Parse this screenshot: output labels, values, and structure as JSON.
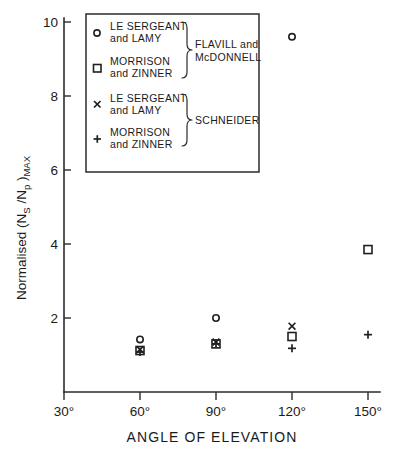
{
  "chart_data": {
    "type": "scatter",
    "title": "",
    "xlabel": "ANGLE OF ELEVATION",
    "ylabel": "Normalised (N_S / N_p)_MAX",
    "ylabel_parts": {
      "prefix": "Normalised (N",
      "sub1": "S",
      "mid": " /N",
      "sub2": "p",
      "close": " )",
      "sub3": "MAX"
    },
    "xlim": [
      30,
      160
    ],
    "ylim": [
      0,
      10
    ],
    "xticks": [
      30,
      60,
      90,
      120,
      150
    ],
    "xtick_labels": [
      "30°",
      "60°",
      "90°",
      "120°",
      "150°"
    ],
    "yticks": [
      2,
      4,
      6,
      8,
      10
    ],
    "ytick_labels": [
      "2",
      "4",
      "6",
      "8",
      "10"
    ],
    "grid": false,
    "legend_position": "upper-left-inside",
    "series": [
      {
        "name": "LE SERGEANT and LAMY",
        "group": "FLAVILL and McDONNELL",
        "marker": "circle",
        "points": [
          {
            "x": 60,
            "y": 1.42
          },
          {
            "x": 90,
            "y": 2.0
          },
          {
            "x": 120,
            "y": 9.6
          }
        ]
      },
      {
        "name": "MORRISON and ZINNER",
        "group": "FLAVILL and McDONNELL",
        "marker": "square",
        "points": [
          {
            "x": 60,
            "y": 1.12
          },
          {
            "x": 90,
            "y": 1.3
          },
          {
            "x": 120,
            "y": 1.5
          },
          {
            "x": 150,
            "y": 3.85
          }
        ]
      },
      {
        "name": "LE SERGEANT and LAMY",
        "group": "SCHNEIDER",
        "marker": "cross",
        "points": [
          {
            "x": 60,
            "y": 1.15
          },
          {
            "x": 90,
            "y": 1.35
          },
          {
            "x": 120,
            "y": 1.78
          }
        ]
      },
      {
        "name": "MORRISON and ZINNER",
        "group": "SCHNEIDER",
        "marker": "plus",
        "points": [
          {
            "x": 60,
            "y": 1.08
          },
          {
            "x": 90,
            "y": 1.3
          },
          {
            "x": 120,
            "y": 1.18
          },
          {
            "x": 150,
            "y": 1.55
          }
        ]
      }
    ]
  },
  "legend": {
    "entries": [
      {
        "marker": "circle",
        "line1": "LE SERGEANT",
        "line2": "and LAMY"
      },
      {
        "marker": "square",
        "line1": "MORRISON",
        "line2": "and ZINNER"
      },
      {
        "marker": "cross",
        "line1": "LE SERGEANT",
        "line2": "and LAMY"
      },
      {
        "marker": "plus",
        "line1": "MORRISON",
        "line2": "and ZINNER"
      }
    ],
    "groups": [
      {
        "line1": "FLAVILL and",
        "line2": "McDONNELL"
      },
      {
        "line1": "SCHNEIDER",
        "line2": ""
      }
    ]
  },
  "axes": {
    "x_title": "ANGLE OF ELEVATION",
    "y_tick_10": "10",
    "y_tick_8": "8",
    "y_tick_6": "6",
    "y_tick_4": "4",
    "y_tick_2": "2",
    "x_tick_30": "30°",
    "x_tick_60": "60°",
    "x_tick_90": "90°",
    "x_tick_120": "120°",
    "x_tick_150": "150°"
  }
}
